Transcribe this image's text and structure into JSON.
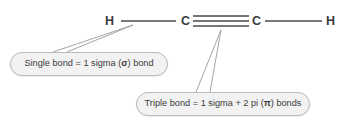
{
  "diagram": {
    "molecule_formula": "H-C#C-H",
    "atoms": [
      {
        "id": "h-left",
        "label": "H",
        "x": 110,
        "y": 21
      },
      {
        "id": "c-left",
        "label": "C",
        "x": 186,
        "y": 21
      },
      {
        "id": "c-right",
        "label": "C",
        "x": 257,
        "y": 21
      },
      {
        "id": "h-right",
        "label": "H",
        "x": 331,
        "y": 21
      }
    ],
    "bonds": [
      {
        "id": "bond-single-left",
        "type": "single",
        "order": 1,
        "from": "h-left",
        "to": "c-left",
        "lines": 1
      },
      {
        "id": "bond-triple",
        "type": "triple",
        "order": 3,
        "from": "c-left",
        "to": "c-right",
        "lines": 3
      },
      {
        "id": "bond-single-right",
        "type": "single",
        "order": 1,
        "from": "c-right",
        "to": "h-right",
        "lines": 1
      }
    ],
    "callouts": [
      {
        "id": "callout-single",
        "target_bond": "bond-single-left",
        "text_before": "Single bond = 1 sigma (",
        "symbol": "σ",
        "text_after": ") bond",
        "full_text": "Single bond = 1 sigma (σ) bond"
      },
      {
        "id": "callout-triple",
        "target_bond": "bond-triple",
        "text_before": "Triple bond = 1 sigma + 2 pi (",
        "symbol": "π",
        "text_after": ") bonds",
        "full_text": "Triple bond = 1 sigma + 2 pi (π) bonds"
      }
    ],
    "colors": {
      "background": "#ffffff",
      "bond_line": "#4a4a4a",
      "atom_text": "#3b3b3b",
      "callout_fill": "#f2f2f2",
      "callout_border": "#b9b9b9",
      "callout_text": "#3b3b3b",
      "leader_line": "#9a9a9a"
    }
  }
}
